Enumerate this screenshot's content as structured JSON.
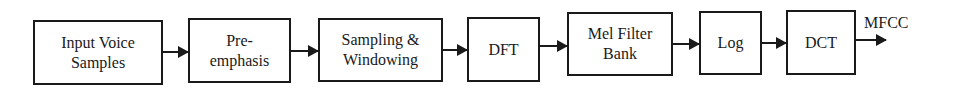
{
  "diagram": {
    "blocks": [
      {
        "id": "input",
        "label": "Input Voice\nSamples"
      },
      {
        "id": "preemphasis",
        "label": "Pre-\nemphasis"
      },
      {
        "id": "sampling",
        "label": "Sampling &\nWindowing"
      },
      {
        "id": "dft",
        "label": "DFT"
      },
      {
        "id": "melfilter",
        "label": "Mel Filter\nBank"
      },
      {
        "id": "log",
        "label": "Log"
      },
      {
        "id": "dct",
        "label": "DCT"
      }
    ],
    "output_label": "MFCC",
    "edges": [
      [
        "input",
        "preemphasis"
      ],
      [
        "preemphasis",
        "sampling"
      ],
      [
        "sampling",
        "dft"
      ],
      [
        "dft",
        "melfilter"
      ],
      [
        "melfilter",
        "log"
      ],
      [
        "log",
        "dct"
      ],
      [
        "dct",
        "MFCC"
      ]
    ]
  }
}
